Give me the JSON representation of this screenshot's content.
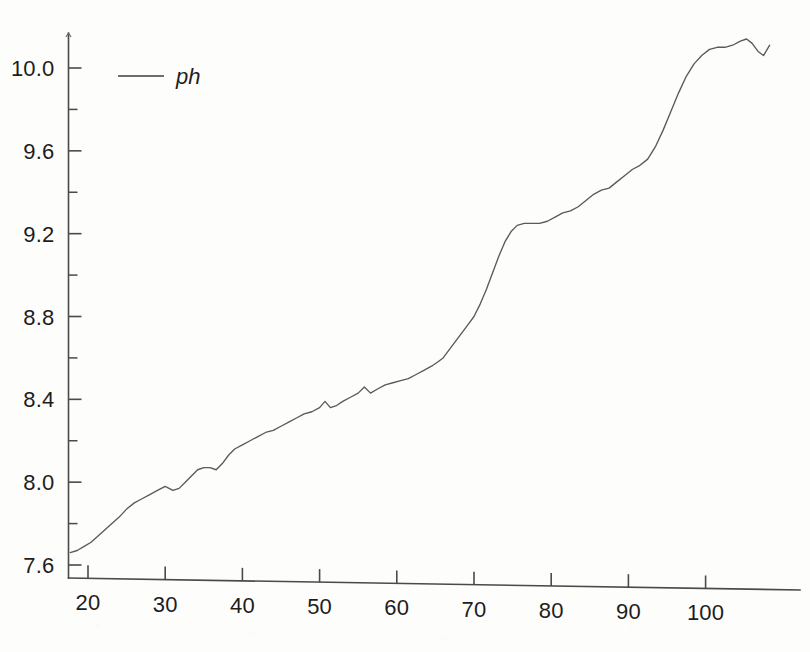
{
  "chart_data": {
    "type": "line",
    "title": "",
    "xlabel": "",
    "ylabel": "",
    "xlim": [
      17.7,
      108.5
    ],
    "ylim": [
      7.5,
      10.25
    ],
    "grid": false,
    "legend_position": "top-left",
    "y_ticks": [
      "7.6",
      "8.0",
      "8.4",
      "8.8",
      "9.2",
      "9.6",
      "10.0"
    ],
    "y_tick_values": [
      7.6,
      8.0,
      8.4,
      8.8,
      9.2,
      9.6,
      10.0
    ],
    "y_minor_tick_values": [
      7.8,
      8.2,
      8.6,
      9.0,
      9.4,
      9.8
    ],
    "x_ticks": [
      "20",
      "30",
      "40",
      "50",
      "60",
      "70",
      "80",
      "90",
      "100"
    ],
    "x_tick_values": [
      20,
      30,
      40,
      50,
      60,
      70,
      80,
      90,
      100
    ],
    "series": [
      {
        "name": "ph",
        "color": "#5a5a5a",
        "x": [
          17.7,
          18.6,
          19.5,
          20.4,
          21.3,
          22.2,
          23.1,
          24.0,
          25.0,
          26.0,
          27.0,
          28.0,
          29.0,
          30.0,
          31.0,
          31.8,
          32.6,
          33.4,
          34.2,
          35.0,
          35.8,
          36.6,
          37.4,
          38.2,
          39.0,
          40.0,
          41.0,
          42.0,
          43.0,
          44.0,
          45.0,
          46.0,
          47.0,
          48.0,
          49.0,
          50.0,
          50.7,
          51.4,
          52.2,
          53.0,
          54.0,
          55.0,
          55.8,
          56.6,
          57.5,
          58.5,
          59.5,
          60.5,
          61.5,
          62.5,
          63.5,
          64.5,
          65.3,
          66.0,
          66.8,
          67.6,
          68.4,
          69.2,
          70.0,
          70.8,
          71.6,
          72.4,
          73.2,
          74.0,
          74.8,
          75.6,
          76.5,
          77.5,
          78.5,
          79.5,
          80.5,
          81.5,
          82.5,
          83.5,
          84.5,
          85.5,
          86.5,
          87.5,
          88.5,
          89.5,
          90.5,
          91.5,
          92.5,
          93.5,
          94.5,
          95.5,
          96.5,
          97.5,
          98.5,
          99.5,
          100.5,
          101.5,
          102.5,
          103.5,
          104.5,
          105.3,
          106.0,
          106.8,
          107.5,
          108.3
        ],
        "y": [
          7.66,
          7.67,
          7.69,
          7.71,
          7.74,
          7.77,
          7.8,
          7.83,
          7.87,
          7.9,
          7.92,
          7.94,
          7.96,
          7.98,
          7.96,
          7.97,
          8.0,
          8.03,
          8.06,
          8.07,
          8.07,
          8.06,
          8.09,
          8.13,
          8.16,
          8.18,
          8.2,
          8.22,
          8.24,
          8.25,
          8.27,
          8.29,
          8.31,
          8.33,
          8.34,
          8.36,
          8.39,
          8.36,
          8.37,
          8.39,
          8.41,
          8.43,
          8.46,
          8.43,
          8.45,
          8.47,
          8.48,
          8.49,
          8.5,
          8.52,
          8.54,
          8.56,
          8.58,
          8.6,
          8.64,
          8.68,
          8.72,
          8.76,
          8.8,
          8.86,
          8.93,
          9.01,
          9.09,
          9.16,
          9.21,
          9.24,
          9.25,
          9.25,
          9.25,
          9.26,
          9.28,
          9.3,
          9.31,
          9.33,
          9.36,
          9.39,
          9.41,
          9.42,
          9.45,
          9.48,
          9.51,
          9.53,
          9.56,
          9.62,
          9.7,
          9.79,
          9.88,
          9.96,
          10.02,
          10.06,
          10.09,
          10.1,
          10.1,
          10.11,
          10.13,
          10.14,
          10.12,
          10.08,
          10.06,
          10.11
        ]
      }
    ]
  },
  "legend": {
    "entries": [
      {
        "label": "ph",
        "color": "#5a5a5a"
      }
    ]
  }
}
